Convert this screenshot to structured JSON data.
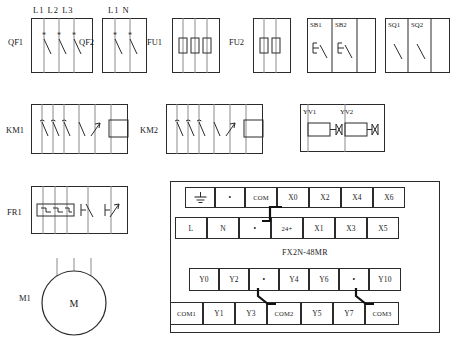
{
  "diagram": {
    "plc_model": "FX2N-48MR"
  },
  "breakers": [
    {
      "name": "QF1",
      "label": "QF1",
      "type": "circuit-breaker",
      "poles": 3,
      "terminal_labels": [
        "L1",
        "L2",
        "L3"
      ],
      "terminals_text": "L1 L2 L3"
    },
    {
      "name": "QF2",
      "label": "QF2",
      "type": "circuit-breaker",
      "poles": 2,
      "terminal_labels": [
        "L1",
        "N"
      ],
      "terminals_text": "L1 N"
    }
  ],
  "fuses": [
    {
      "name": "FU1",
      "label": "FU1",
      "type": "fuse-block",
      "count": 3
    },
    {
      "name": "FU2",
      "label": "FU2",
      "type": "fuse-block",
      "count": 2
    }
  ],
  "pushbuttons": {
    "name": "push-button-block",
    "items": [
      {
        "label": "SB1",
        "type": "push-button-no"
      },
      {
        "label": "SB2",
        "type": "push-button-no"
      }
    ]
  },
  "limit_switches": {
    "name": "limit-switch-block",
    "items": [
      {
        "label": "SQ1",
        "type": "limit-switch"
      },
      {
        "label": "SQ2",
        "type": "limit-switch"
      }
    ]
  },
  "contactors": [
    {
      "name": "KM1",
      "label": "KM1",
      "type": "contactor",
      "main_poles": 3,
      "aux_nc": 1,
      "aux_no": 1,
      "coil": true
    },
    {
      "name": "KM2",
      "label": "KM2",
      "type": "contactor",
      "main_poles": 3,
      "aux_nc": 1,
      "aux_no": 1,
      "coil": true
    }
  ],
  "solenoids": {
    "name": "solenoid-valve-block",
    "items": [
      {
        "label": "YV1",
        "type": "solenoid-valve"
      },
      {
        "label": "YV2",
        "type": "solenoid-valve"
      }
    ]
  },
  "overload_relay": {
    "name": "FR1",
    "label": "FR1",
    "type": "thermal-overload-relay",
    "heaters": 3,
    "contacts": [
      "nc",
      "no"
    ]
  },
  "motor": {
    "name": "M1",
    "label": "M1",
    "symbol": "M",
    "type": "three-phase-motor",
    "leads": 3
  },
  "plc": {
    "model_label": "FX2N-48MR",
    "input_rows": {
      "top": [
        {
          "label": "",
          "kind": "blank"
        },
        {
          "label": "",
          "kind": "ground-icon"
        },
        {
          "label": "•",
          "kind": "dot"
        },
        {
          "label": "COM",
          "kind": "terminal"
        },
        {
          "label": "X0",
          "kind": "terminal"
        },
        {
          "label": "X2",
          "kind": "terminal"
        },
        {
          "label": "X4",
          "kind": "terminal"
        },
        {
          "label": "X6",
          "kind": "terminal"
        }
      ],
      "bottom": [
        {
          "label": "L",
          "kind": "terminal"
        },
        {
          "label": "N",
          "kind": "terminal"
        },
        {
          "label": "•",
          "kind": "dot"
        },
        {
          "label": "24+",
          "kind": "terminal"
        },
        {
          "label": "X1",
          "kind": "terminal"
        },
        {
          "label": "X3",
          "kind": "terminal"
        },
        {
          "label": "X5",
          "kind": "terminal"
        }
      ]
    },
    "output_rows": {
      "top": [
        {
          "label": "Y0",
          "kind": "terminal"
        },
        {
          "label": "Y2",
          "kind": "terminal"
        },
        {
          "label": "•",
          "kind": "dot"
        },
        {
          "label": "Y4",
          "kind": "terminal"
        },
        {
          "label": "Y6",
          "kind": "terminal"
        },
        {
          "label": "•",
          "kind": "dot"
        },
        {
          "label": "Y10",
          "kind": "terminal"
        }
      ],
      "bottom": [
        {
          "label": "COM1",
          "kind": "terminal"
        },
        {
          "label": "Y1",
          "kind": "terminal"
        },
        {
          "label": "Y3",
          "kind": "terminal"
        },
        {
          "label": "COM2",
          "kind": "terminal"
        },
        {
          "label": "Y5",
          "kind": "terminal"
        },
        {
          "label": "Y7",
          "kind": "terminal"
        },
        {
          "label": "COM3",
          "kind": "terminal"
        }
      ]
    }
  },
  "colors": {
    "ink": "#1a1a1a",
    "line": "#2b2b2b",
    "rail": "#8a8a8a",
    "paper": "#ffffff"
  }
}
